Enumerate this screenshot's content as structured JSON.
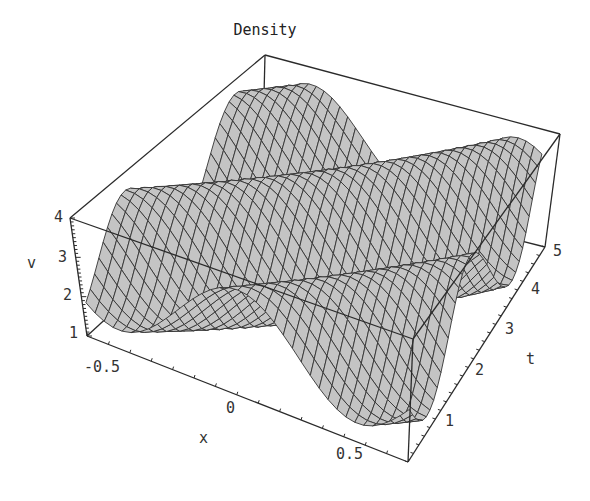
{
  "chart_data": {
    "type": "surface3d",
    "title": "Density",
    "xlabel": "x",
    "ylabel": "t",
    "zlabel": "v",
    "x_range": [
      -0.75,
      0.75
    ],
    "t_range": [
      0.5,
      5.5
    ],
    "v_range": [
      1,
      4
    ],
    "x_ticks": [
      -0.5,
      0,
      0.5
    ],
    "t_ticks": [
      1,
      2,
      3,
      4,
      5
    ],
    "v_ticks": [
      1,
      2,
      3,
      4
    ],
    "x_tick_labels": [
      "-0.5",
      "0",
      "0.5"
    ],
    "t_tick_labels": [
      "1",
      "2",
      "3",
      "4",
      "5"
    ],
    "v_tick_labels": [
      "1",
      "2",
      "3",
      "4"
    ],
    "grid": false,
    "boxed": true,
    "mesh": true,
    "surface_color": "#c4c4c4"
  },
  "labels": {
    "title": "Density",
    "x_axis": "x",
    "t_axis": "t",
    "v_axis": "v",
    "x_ticks": [
      "-0.5",
      "0",
      "0.5"
    ],
    "t_ticks": [
      "1",
      "2",
      "3",
      "4",
      "5"
    ],
    "v_ticks": [
      "1",
      "2",
      "3",
      "4"
    ]
  }
}
